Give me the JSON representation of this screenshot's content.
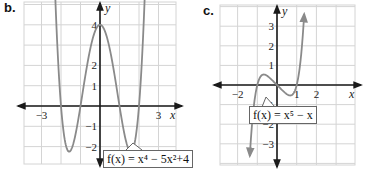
{
  "chart_data": [
    {
      "id": "b",
      "panel_label": "b.",
      "type": "line",
      "function_label": "f(x) = x⁴ − 5x²+4",
      "function_expr": "x^4 - 5x^2 + 4",
      "xlabel": "x",
      "ylabel": "y",
      "xlim": [
        -3.9,
        3.9
      ],
      "ylim": [
        -2.9,
        5.1
      ],
      "x_tick_labels": [
        {
          "value": -3,
          "label": "−3"
        },
        {
          "value": 3,
          "label": "3"
        }
      ],
      "y_tick_labels": [
        {
          "value": 4,
          "label": "4"
        },
        {
          "value": 2,
          "label": "2"
        },
        {
          "value": 1,
          "label": "1"
        },
        {
          "value": -1,
          "label": "−1"
        },
        {
          "value": -2,
          "label": "−2"
        }
      ],
      "grid": true,
      "grid_step": 1,
      "curve_domain": [
        -2.62,
        2.62
      ],
      "key_points": [
        {
          "x": -1.58,
          "y": -2.25
        },
        {
          "x": 0,
          "y": 4
        },
        {
          "x": 1.58,
          "y": -2.25
        }
      ],
      "zeros": [
        -2,
        -1,
        1,
        2
      ]
    },
    {
      "id": "c",
      "panel_label": "c.",
      "type": "line",
      "function_label": "f(x) = x⁵ − x",
      "function_expr": "x^5 - x",
      "xlabel": "x",
      "ylabel": "y",
      "xlim": [
        -2.9,
        4.0
      ],
      "ylim": [
        -4.1,
        4.1
      ],
      "x_tick_labels": [
        {
          "value": -2,
          "label": "−2"
        },
        {
          "value": 1,
          "label": "1"
        },
        {
          "value": 2,
          "label": "2"
        }
      ],
      "y_tick_labels": [
        {
          "value": 3,
          "label": "3"
        },
        {
          "value": 2,
          "label": "2"
        },
        {
          "value": 1,
          "label": "1"
        },
        {
          "value": -1,
          "label": "−1"
        },
        {
          "value": -2,
          "label": "−2"
        },
        {
          "value": -3,
          "label": "−3"
        }
      ],
      "grid": true,
      "grid_step": 1,
      "curve_domain": [
        -1.38,
        1.38
      ],
      "key_points": [
        {
          "x": -0.67,
          "y": 0.53
        },
        {
          "x": 0.67,
          "y": -0.53
        }
      ],
      "zeros": [
        -1,
        0,
        1
      ]
    }
  ],
  "colors": {
    "curve": "#8a8a8a",
    "axis": "#1a1a1a",
    "grid": "#d4d4d4",
    "callout_border": "#666666"
  }
}
